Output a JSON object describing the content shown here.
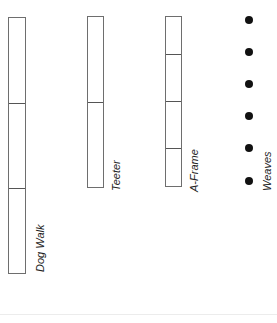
{
  "diagram": {
    "title": "",
    "obstacles": [
      {
        "name": "Dog Walk",
        "segments": 3,
        "type": "plank"
      },
      {
        "name": "Teeter",
        "segments": 2,
        "type": "plank"
      },
      {
        "name": "A-Frame",
        "segments": 4,
        "type": "plank"
      },
      {
        "name": "Weaves",
        "poles": 6,
        "type": "poles"
      }
    ],
    "colors": {
      "outline": "#6e6e6e",
      "pole": "#111111",
      "background": "#ffffff"
    }
  }
}
